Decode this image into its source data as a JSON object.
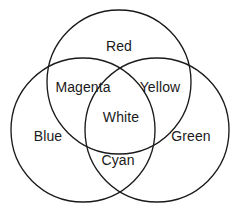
{
  "diagram": {
    "background_color": "#ffffff",
    "stroke_color": "#1a1a1a",
    "text_color": "#1a1a1a",
    "circles": [
      {
        "name": "red-circle",
        "label": "Red",
        "cx": 119,
        "cy": 82,
        "r": 72
      },
      {
        "name": "blue-circle",
        "label": "Blue",
        "cx": 83,
        "cy": 130,
        "r": 72
      },
      {
        "name": "green-circle",
        "label": "Green",
        "cx": 157,
        "cy": 130,
        "r": 72
      }
    ],
    "labels": [
      {
        "name": "label-red",
        "text": "Red",
        "x": 119,
        "y": 46
      },
      {
        "name": "label-magenta",
        "text": "Magenta",
        "x": 83,
        "y": 87
      },
      {
        "name": "label-yellow",
        "text": "Yellow",
        "x": 160,
        "y": 87
      },
      {
        "name": "label-white",
        "text": "White",
        "x": 121,
        "y": 117
      },
      {
        "name": "label-blue",
        "text": "Blue",
        "x": 48,
        "y": 136
      },
      {
        "name": "label-green",
        "text": "Green",
        "x": 191,
        "y": 136
      },
      {
        "name": "label-cyan",
        "text": "Cyan",
        "x": 118,
        "y": 160
      }
    ]
  }
}
